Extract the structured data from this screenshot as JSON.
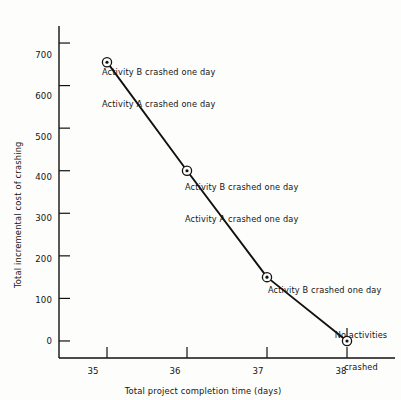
{
  "chart_data": {
    "type": "line",
    "title": "",
    "xlabel": "Total project completion time (days)",
    "ylabel": "Total incremental cost of crashing",
    "x": [
      35,
      36,
      37,
      38
    ],
    "values": [
      655,
      400,
      150,
      0
    ],
    "series": [
      {
        "name": "Total incremental cost of crashing",
        "values": [
          655,
          400,
          150,
          0
        ]
      }
    ],
    "xlim": [
      34.4,
      38.6
    ],
    "ylim": [
      -40,
      740
    ],
    "xticks": [
      35,
      36,
      37,
      38
    ],
    "xtick_labels": [
      "35",
      "36",
      "37",
      "38"
    ],
    "yticks": [
      0,
      100,
      200,
      300,
      400,
      500,
      600,
      700
    ],
    "ytick_labels": [
      "0",
      "100",
      "200",
      "300",
      "400",
      "500",
      "600",
      "700"
    ],
    "grid": false,
    "legend": "none",
    "marker": "circle-dot",
    "line_color": "#111111",
    "annotations": [
      {
        "point_x": 35,
        "point_y": 655,
        "lines": [
          "Activity B crashed one day",
          "Activity A crashed one day"
        ],
        "align": "left"
      },
      {
        "point_x": 36,
        "point_y": 400,
        "lines": [
          "Activity B crashed one day",
          "Activity A crashed one day"
        ],
        "align": "left"
      },
      {
        "point_x": 37,
        "point_y": 150,
        "lines": [
          "Activity B crashed one day"
        ],
        "align": "left"
      },
      {
        "point_x": 38,
        "point_y": 0,
        "lines": [
          "No activities",
          "crashed"
        ],
        "align": "center"
      }
    ]
  },
  "axes": {
    "y_title": "Total incremental cost of crashing",
    "x_title": "Total project completion time (days)",
    "y_ticks": [
      "700",
      "600",
      "500",
      "400",
      "300",
      "200",
      "100",
      "0"
    ],
    "x_ticks": [
      "35",
      "36",
      "37",
      "38"
    ]
  },
  "annotations": {
    "a1_line1": "Activity B crashed one day",
    "a1_line2": "Activity A crashed one day",
    "a2_line1": "Activity B crashed one day",
    "a2_line2": "Activity A crashed one day",
    "a3_line1": "Activity B crashed one day",
    "a4_line1": "No activities",
    "a4_line2": "crashed"
  },
  "colors": {
    "background": "#fdfdfb",
    "ink": "#111111",
    "text": "#141414"
  }
}
